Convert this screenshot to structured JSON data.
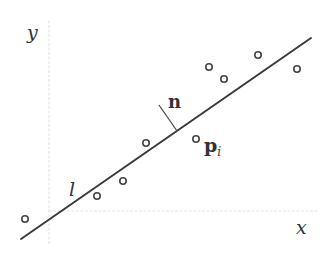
{
  "diagram": {
    "axes": {
      "x_label": "x",
      "y_label": "y",
      "origin": [
        49,
        211
      ],
      "x_end": [
        318,
        211
      ],
      "y_end": [
        49,
        20
      ]
    },
    "line": {
      "label": "l",
      "start": [
        21,
        239
      ],
      "end": [
        311,
        38
      ]
    },
    "normal": {
      "label": "n",
      "from": [
        177,
        131
      ],
      "to": [
        159,
        105
      ]
    },
    "highlighted_point": {
      "label_main": "p",
      "label_sub": "i",
      "position": [
        196,
        139
      ]
    },
    "points": [
      [
        25,
        219
      ],
      [
        97,
        196
      ],
      [
        123,
        181
      ],
      [
        146,
        143
      ],
      [
        196,
        139
      ],
      [
        209,
        67
      ],
      [
        224,
        79
      ],
      [
        258,
        55
      ],
      [
        297,
        69
      ]
    ],
    "colors": {
      "line": "#3a3a3a",
      "axis": "#e4e4e4",
      "text": "#333333"
    }
  }
}
